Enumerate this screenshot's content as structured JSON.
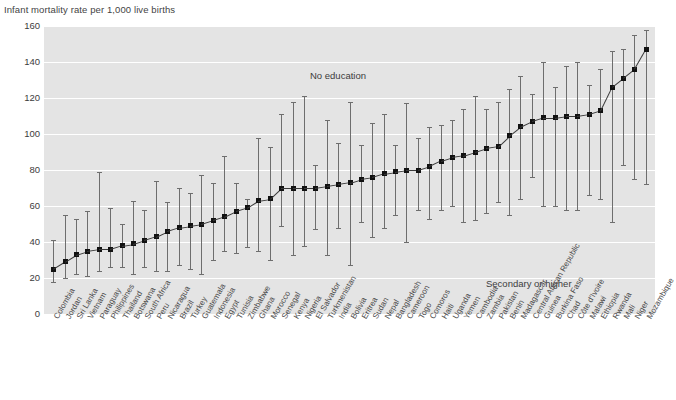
{
  "axis_title": "Infant mortality rate per 1,000 live births",
  "annotations": {
    "upper": "No education",
    "lower": "Secondary or higher"
  },
  "chart_data": {
    "type": "scatter",
    "title": "",
    "xlabel": "",
    "ylabel": "Infant mortality rate per 1,000 live births",
    "ylim": [
      0,
      160
    ],
    "yticks": [
      0,
      20,
      40,
      60,
      80,
      100,
      120,
      140,
      160
    ],
    "grid": true,
    "legend_position": "in-plot annotations",
    "series_note": "Point = value for 'No education'; error bar spans from 'Secondary or higher' (lower cap) to 'No education' upper bound",
    "categories": [
      "Colombia",
      "Jordan",
      "Sri Lanka",
      "Vietnam",
      "Paraguay",
      "Philippines",
      "Thailand",
      "Botswana",
      "South Africa",
      "Peru",
      "Nicaragua",
      "Brazil",
      "Turkey",
      "Guatemala",
      "Indonesia",
      "Egypt",
      "Tunisia",
      "Zimbabwe",
      "Ghana",
      "Morocco",
      "Senegal",
      "Kenya",
      "Nigeria",
      "El Salvador",
      "Turkmenistan",
      "India",
      "Bolivia",
      "Eritrea",
      "Sudan",
      "Nepal",
      "Bangladesh",
      "Cameroon",
      "Togo",
      "Comoros",
      "Haiti",
      "Uganda",
      "Yemen",
      "Cambodia",
      "Zambia",
      "Pakistan",
      "Benin",
      "Madagascar",
      "Central African Republic",
      "Guinea",
      "Burkina Faso",
      "Chad",
      "Côte d'Ivoire",
      "Malawi",
      "Ethiopia",
      "Rwanda",
      "Mali",
      "Niger",
      "Mozambique"
    ],
    "values": [
      25,
      29,
      33,
      35,
      36,
      36,
      38,
      39,
      41,
      43,
      46,
      48,
      49,
      50,
      52,
      54,
      57,
      59,
      63,
      64,
      70,
      70,
      70,
      70,
      71,
      72,
      73,
      75,
      76,
      78,
      79,
      80,
      80,
      82,
      85,
      87,
      88,
      90,
      92,
      93,
      99,
      104,
      107,
      109,
      109,
      110,
      110,
      111,
      113,
      126,
      131,
      136,
      147
    ],
    "upper": [
      41,
      55,
      53,
      57,
      79,
      59,
      50,
      63,
      58,
      74,
      62,
      70,
      67,
      77,
      73,
      88,
      73,
      64,
      98,
      93,
      111,
      118,
      121,
      83,
      108,
      95,
      118,
      94,
      106,
      111,
      94,
      117,
      98,
      104,
      105,
      108,
      114,
      121,
      114,
      118,
      125,
      132,
      122,
      140,
      126,
      138,
      140,
      127,
      136,
      146,
      147,
      155,
      158
    ],
    "lower": [
      18,
      20,
      22,
      21,
      24,
      26,
      26,
      22,
      26,
      24,
      24,
      27,
      25,
      22,
      30,
      35,
      34,
      37,
      35,
      30,
      49,
      33,
      38,
      47,
      33,
      48,
      27,
      51,
      43,
      48,
      55,
      40,
      58,
      53,
      58,
      60,
      51,
      52,
      56,
      62,
      55,
      64,
      76,
      60,
      60,
      58,
      58,
      66,
      64,
      51,
      83,
      75,
      72
    ]
  }
}
